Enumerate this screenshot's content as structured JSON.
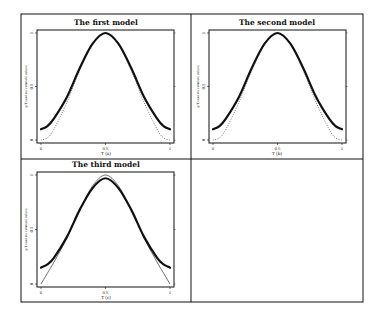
{
  "figure": {
    "panels": [
      {
        "id": "a",
        "title": "The first model",
        "xlabel": "T  (a)",
        "ylabel": "g(T) and its estimate values"
      },
      {
        "id": "b",
        "title": "The second model",
        "xlabel": "T  (b)",
        "ylabel": "g(T) and its estimate values"
      },
      {
        "id": "c",
        "title": "The third model",
        "xlabel": "T  (c)",
        "ylabel": "g(T) and its estimate values"
      },
      {
        "id": "d",
        "title": "",
        "xlabel": "",
        "ylabel": ""
      }
    ],
    "xticks": [
      "0",
      "0.5",
      "1"
    ],
    "yticks": [
      "0",
      "0.5",
      "1"
    ]
  },
  "chart_data": [
    {
      "type": "line",
      "title": "The first model",
      "xlabel": "T  (a)",
      "ylabel": "g(T) and its estimate values",
      "xlim": [
        0,
        1
      ],
      "ylim": [
        0,
        1
      ],
      "x": [
        0,
        0.05,
        0.1,
        0.2,
        0.3,
        0.4,
        0.5,
        0.6,
        0.7,
        0.8,
        0.9,
        0.95,
        1
      ],
      "series": [
        {
          "name": "g(T)",
          "style": "dotted",
          "values": [
            0.0,
            0.02,
            0.1,
            0.35,
            0.65,
            0.9,
            1.0,
            0.9,
            0.65,
            0.35,
            0.1,
            0.02,
            0.0
          ]
        },
        {
          "name": "estimate",
          "style": "solid-thick",
          "values": [
            0.1,
            0.13,
            0.2,
            0.4,
            0.67,
            0.9,
            1.0,
            0.9,
            0.67,
            0.4,
            0.2,
            0.13,
            0.1
          ]
        }
      ]
    },
    {
      "type": "line",
      "title": "The second model",
      "xlabel": "T  (b)",
      "ylabel": "g(T) and its estimate values",
      "xlim": [
        0,
        1
      ],
      "ylim": [
        0,
        1
      ],
      "x": [
        0,
        0.05,
        0.1,
        0.2,
        0.3,
        0.4,
        0.5,
        0.6,
        0.7,
        0.8,
        0.9,
        0.95,
        1
      ],
      "series": [
        {
          "name": "g(T)",
          "style": "dotted",
          "values": [
            0.0,
            0.02,
            0.1,
            0.35,
            0.65,
            0.9,
            1.0,
            0.9,
            0.65,
            0.35,
            0.1,
            0.02,
            0.0
          ]
        },
        {
          "name": "estimate",
          "style": "solid-thick",
          "values": [
            0.1,
            0.13,
            0.2,
            0.4,
            0.67,
            0.9,
            1.0,
            0.9,
            0.67,
            0.4,
            0.2,
            0.13,
            0.1
          ]
        }
      ]
    },
    {
      "type": "line",
      "title": "The third model",
      "xlabel": "T  (c)",
      "ylabel": "g(T) and its estimate values",
      "xlim": [
        0,
        1
      ],
      "ylim": [
        0,
        1
      ],
      "x": [
        0,
        0.05,
        0.1,
        0.2,
        0.3,
        0.4,
        0.5,
        0.6,
        0.7,
        0.8,
        0.9,
        0.95,
        1
      ],
      "series": [
        {
          "name": "g(T)",
          "style": "thin",
          "values": [
            0.0,
            0.1,
            0.2,
            0.42,
            0.68,
            0.9,
            1.0,
            0.9,
            0.68,
            0.42,
            0.2,
            0.1,
            0.0
          ]
        },
        {
          "name": "estimate",
          "style": "solid-thick",
          "values": [
            0.15,
            0.18,
            0.24,
            0.43,
            0.68,
            0.88,
            0.97,
            0.88,
            0.68,
            0.43,
            0.24,
            0.18,
            0.15
          ]
        }
      ]
    }
  ]
}
